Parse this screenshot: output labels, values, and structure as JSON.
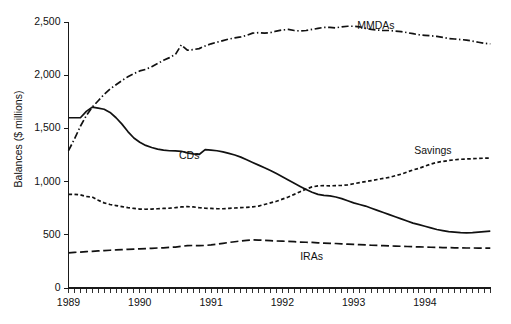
{
  "chart_data": {
    "type": "line",
    "title": "",
    "subtitle": "",
    "xlabel": "",
    "ylabel": "Balances ($ millions)",
    "xlim": [
      1989.0,
      1994.92
    ],
    "ylim": [
      0,
      2500
    ],
    "yticks": [
      0,
      500,
      1000,
      1500,
      2000,
      2500
    ],
    "ytick_labels": [
      "0",
      "500",
      "1,000",
      "1,500",
      "2,000",
      "2,500"
    ],
    "xticks": [
      1989,
      1990,
      1991,
      1992,
      1993,
      1994
    ],
    "xtick_labels": [
      "1989",
      "1990",
      "1991",
      "1992",
      "1993",
      "1994"
    ],
    "x_minor_ticks": "monthly",
    "grid": false,
    "legend": "inline-annotations",
    "annotations": [
      {
        "text": "MMDAs",
        "x": 1993.05,
        "y": 2465
      },
      {
        "text": "CDs",
        "x": 1990.55,
        "y": 1240
      },
      {
        "text": "Savings",
        "x": 1993.85,
        "y": 1290
      },
      {
        "text": "IRAs",
        "x": 1992.25,
        "y": 290
      }
    ],
    "x": [
      1989.0,
      1989.083,
      1989.167,
      1989.25,
      1989.333,
      1989.417,
      1989.5,
      1989.583,
      1989.667,
      1989.75,
      1989.833,
      1989.917,
      1990.0,
      1990.083,
      1990.167,
      1990.25,
      1990.333,
      1990.417,
      1990.5,
      1990.583,
      1990.667,
      1990.75,
      1990.833,
      1990.917,
      1991.0,
      1991.083,
      1991.167,
      1991.25,
      1991.333,
      1991.417,
      1991.5,
      1991.583,
      1991.667,
      1991.75,
      1991.833,
      1991.917,
      1992.0,
      1992.083,
      1992.167,
      1992.25,
      1992.333,
      1992.417,
      1992.5,
      1992.583,
      1992.667,
      1992.75,
      1992.833,
      1992.917,
      1993.0,
      1993.083,
      1993.167,
      1993.25,
      1993.333,
      1993.417,
      1993.5,
      1993.583,
      1993.667,
      1993.75,
      1993.833,
      1993.917,
      1994.0,
      1994.083,
      1994.167,
      1994.25,
      1994.333,
      1994.417,
      1994.5,
      1994.583,
      1994.667,
      1994.75,
      1994.833,
      1994.917
    ],
    "series": [
      {
        "name": "MMDAs",
        "style": "dash-dot",
        "values": [
          1290,
          1400,
          1520,
          1620,
          1700,
          1760,
          1820,
          1870,
          1910,
          1950,
          1985,
          2015,
          2040,
          2055,
          2080,
          2110,
          2140,
          2165,
          2195,
          2285,
          2235,
          2240,
          2250,
          2275,
          2295,
          2310,
          2325,
          2340,
          2350,
          2360,
          2375,
          2395,
          2400,
          2395,
          2400,
          2415,
          2425,
          2430,
          2420,
          2415,
          2420,
          2430,
          2440,
          2450,
          2450,
          2445,
          2455,
          2460,
          2460,
          2455,
          2440,
          2430,
          2425,
          2420,
          2420,
          2415,
          2410,
          2400,
          2390,
          2380,
          2375,
          2370,
          2365,
          2355,
          2345,
          2340,
          2335,
          2330,
          2320,
          2310,
          2300,
          2295
        ]
      },
      {
        "name": "CDs",
        "style": "solid",
        "values": [
          1600,
          1600,
          1600,
          1660,
          1700,
          1690,
          1680,
          1650,
          1600,
          1540,
          1470,
          1410,
          1370,
          1340,
          1320,
          1305,
          1295,
          1290,
          1288,
          1285,
          1270,
          1260,
          1255,
          1300,
          1295,
          1290,
          1280,
          1265,
          1250,
          1230,
          1205,
          1180,
          1155,
          1130,
          1105,
          1075,
          1045,
          1015,
          985,
          955,
          925,
          900,
          880,
          870,
          865,
          855,
          840,
          820,
          800,
          785,
          770,
          750,
          730,
          710,
          690,
          670,
          650,
          630,
          610,
          595,
          580,
          565,
          550,
          540,
          530,
          525,
          520,
          518,
          520,
          525,
          530,
          535
        ]
      },
      {
        "name": "Savings",
        "style": "short-dash",
        "values": [
          880,
          880,
          875,
          860,
          855,
          825,
          800,
          785,
          775,
          765,
          755,
          748,
          742,
          740,
          742,
          745,
          748,
          750,
          755,
          762,
          765,
          762,
          755,
          750,
          748,
          745,
          745,
          748,
          752,
          755,
          758,
          762,
          770,
          785,
          800,
          815,
          835,
          855,
          880,
          905,
          930,
          950,
          960,
          962,
          960,
          962,
          965,
          970,
          980,
          990,
          1000,
          1010,
          1020,
          1030,
          1040,
          1055,
          1070,
          1090,
          1110,
          1125,
          1145,
          1165,
          1180,
          1190,
          1198,
          1205,
          1210,
          1213,
          1215,
          1218,
          1220,
          1220
        ]
      },
      {
        "name": "IRAs",
        "style": "long-dash",
        "values": [
          330,
          335,
          338,
          342,
          345,
          348,
          352,
          355,
          358,
          360,
          363,
          366,
          368,
          370,
          373,
          376,
          378,
          382,
          385,
          392,
          398,
          400,
          398,
          400,
          405,
          412,
          420,
          428,
          435,
          442,
          448,
          452,
          450,
          448,
          445,
          442,
          440,
          438,
          435,
          432,
          430,
          428,
          425,
          422,
          420,
          418,
          415,
          412,
          410,
          408,
          405,
          402,
          400,
          398,
          396,
          394,
          392,
          390,
          388,
          386,
          385,
          383,
          382,
          380,
          379,
          378,
          377,
          376,
          376,
          375,
          375,
          375
        ]
      }
    ]
  }
}
